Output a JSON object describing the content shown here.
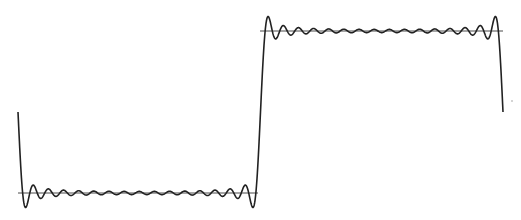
{
  "chart_data": {
    "type": "line",
    "title": "",
    "xlabel": "",
    "ylabel": "",
    "grid": false,
    "legend": null,
    "series": [
      {
        "name": "fourier-partial-sum",
        "function": "square wave, odd harmonics",
        "x_range": [
          -3.1416,
          3.1416
        ],
        "harmonics_odd_max": 31,
        "levels": [
          -1,
          1
        ],
        "overshoot_fraction": 0.09,
        "key_points": [
          {
            "x": -3.1416,
            "y": 0
          },
          {
            "x": -3.05,
            "y": -1.18
          },
          {
            "x": 0,
            "y": 0
          },
          {
            "x": 0.1,
            "y": 1.18
          },
          {
            "x": 3.04,
            "y": 1.18
          },
          {
            "x": 3.1416,
            "y": 0
          }
        ]
      },
      {
        "name": "reference-low",
        "y": -1,
        "x_range": [
          -3.1416,
          0.05
        ]
      },
      {
        "name": "reference-high",
        "y": 1,
        "x_range": [
          -0.05,
          3.1416
        ]
      }
    ],
    "colors": {
      "curve": "#222222",
      "reference": "#4a4a4a",
      "background": "#ffffff"
    }
  },
  "layout_px": {
    "x_left": 18,
    "x_right": 503,
    "y_mid": 112,
    "half_amp": 81,
    "low_line": {
      "x1": 18,
      "x2": 258,
      "y": 193
    },
    "high_line": {
      "x1": 260,
      "x2": 503,
      "y": 31
    }
  }
}
